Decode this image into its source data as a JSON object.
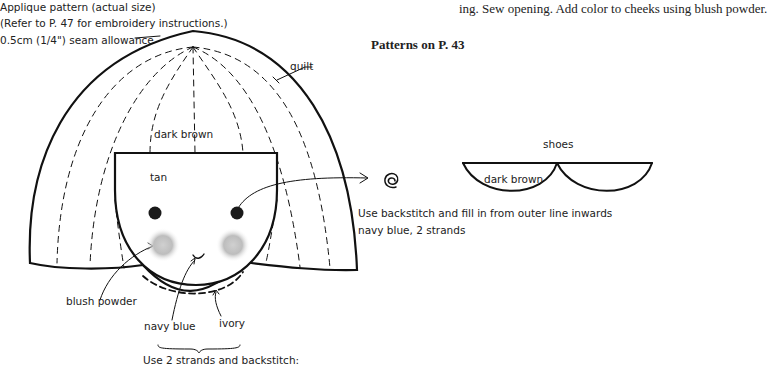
{
  "header": {
    "title": "Applique pattern (actual size)",
    "reference": "(Refer to P. 47 for embroidery instructions.)",
    "seam_allowance": "0.5cm (1/4\") seam allowance"
  },
  "top_right_text": "ing. Sew opening. Add color to cheeks using blush powder.",
  "section_heading": "Patterns on P. 43",
  "labels": {
    "quilt": "quilt",
    "hair": "dark brown",
    "face": "tan",
    "blush": "blush powder",
    "mouth": "navy blue",
    "chin": "ivory",
    "stitch_note": "Use 2 strands and backstitch:",
    "eye_note_line1": "Use backstitch and fill in from outer line inwards",
    "eye_note_line2": "navy blue, 2 strands",
    "shoes_title": "shoes",
    "shoes_color": "dark brown"
  },
  "colors": {
    "ink": "#111111",
    "blush": "#b8b8b8",
    "eye": "#1a1a1a"
  }
}
